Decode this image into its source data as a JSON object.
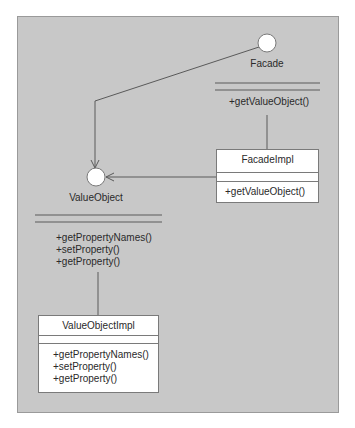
{
  "diagram": {
    "interfaces": [
      {
        "name": "Facade",
        "operations": [
          "+getValueObject()"
        ]
      },
      {
        "name": "ValueObject",
        "operations": [
          "+getPropertyNames()",
          "+setProperty()",
          "+getProperty()"
        ]
      }
    ],
    "classes": [
      {
        "name": "FacadeImpl",
        "attributes": [],
        "operations": [
          "+getValueObject()"
        ]
      },
      {
        "name": "ValueObjectImpl",
        "attributes": [],
        "operations": [
          "+getPropertyNames()",
          "+setProperty()",
          "+getProperty()"
        ]
      }
    ],
    "relationships": [
      {
        "from": "Facade",
        "to": "ValueObject",
        "type": "dependency"
      },
      {
        "from": "FacadeImpl",
        "to": "ValueObject",
        "type": "dependency"
      },
      {
        "from": "FacadeImpl",
        "to": "Facade",
        "type": "realization"
      },
      {
        "from": "ValueObjectImpl",
        "to": "ValueObject",
        "type": "realization"
      }
    ],
    "colors": {
      "panel": "#c8c8c8",
      "box": "#ffffff",
      "line": "#5a5a5a"
    }
  }
}
